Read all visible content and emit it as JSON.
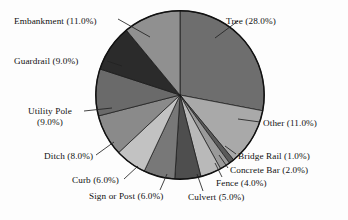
{
  "chart_data": {
    "type": "pie",
    "title": "",
    "subtitle": "",
    "xlabel": "",
    "ylabel": "",
    "legend_position": "none",
    "grid": false,
    "value_unit": "percent",
    "categories": [
      "Tree",
      "Other",
      "Bridge Rail",
      "Concrete Bar",
      "Fence",
      "Culvert",
      "Sign or Post",
      "Curb",
      "Ditch",
      "Utility Pole",
      "Guardrail",
      "Embankment"
    ],
    "values": [
      28.0,
      11.0,
      1.0,
      2.0,
      4.0,
      5.0,
      6.0,
      6.0,
      8.0,
      9.0,
      9.0,
      11.0
    ],
    "total": 100.0,
    "start_angle_deg": 0,
    "direction": "clockwise",
    "slices": [
      {
        "name": "Tree",
        "value": 28.0,
        "label": "Tree (28.0%)",
        "color": "#6e6e6e"
      },
      {
        "name": "Other",
        "value": 11.0,
        "label": "Other (11.0%)",
        "color": "#a9a9a9"
      },
      {
        "name": "Bridge Rail",
        "value": 1.0,
        "label": "Bridge Rail (1.0%)",
        "color": "#5a5a5a"
      },
      {
        "name": "Concrete Bar",
        "value": 2.0,
        "label": "Concrete Bar (2.0%)",
        "color": "#9a9a9a"
      },
      {
        "name": "Fence",
        "value": 4.0,
        "label": "Fence (4.0%)",
        "color": "#b9b9b9"
      },
      {
        "name": "Culvert",
        "value": 5.0,
        "label": "Culvert (5.0%)",
        "color": "#4e4e4e"
      },
      {
        "name": "Sign or Post",
        "value": 6.0,
        "label": "Sign or Post (6.0%)",
        "color": "#787878"
      },
      {
        "name": "Curb",
        "value": 6.0,
        "label": "Curb (6.0%)",
        "color": "#c2c2c2"
      },
      {
        "name": "Ditch",
        "value": 8.0,
        "label": "Ditch (8.0%)",
        "color": "#8a8a8a"
      },
      {
        "name": "Utility Pole",
        "value": 9.0,
        "label": "Utility Pole\n(9.0%)",
        "color": "#6a6a6a"
      },
      {
        "name": "Guardrail",
        "value": 9.0,
        "label": "Guardrail (9.0%)",
        "color": "#2b2b2b"
      },
      {
        "name": "Embankment",
        "value": 11.0,
        "label": "Embankment (11.0%)",
        "color": "#909090"
      }
    ]
  },
  "labels": {
    "tree": "Tree (28.0%)",
    "other": "Other (11.0%)",
    "bridge_rail": "Bridge Rail (1.0%)",
    "concrete_bar": "Concrete Bar (2.0%)",
    "fence": "Fence (4.0%)",
    "culvert": "Culvert (5.0%)",
    "sign_or_post": "Sign or Post (6.0%)",
    "curb": "Curb (6.0%)",
    "ditch": "Ditch (8.0%)",
    "utility_pole_line1": "Utility Pole",
    "utility_pole_line2": "(9.0%)",
    "guardrail": "Guardrail (9.0%)",
    "embankment": "Embankment (11.0%)"
  },
  "style": {
    "background": "#fdfdfd",
    "outline": "#111111",
    "leader_line": "#222222",
    "text": "#111111"
  }
}
